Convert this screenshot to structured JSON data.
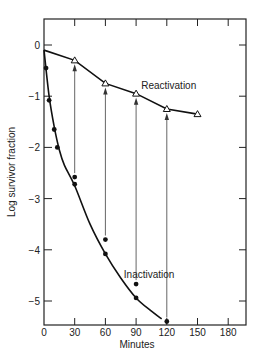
{
  "chart_data": {
    "type": "line",
    "title": "",
    "xlabel": "Minutes",
    "ylabel": "Log survivor fraction",
    "xlim": [
      0,
      195
    ],
    "ylim": [
      -5.5,
      0.5
    ],
    "xticks": [
      0,
      30,
      60,
      90,
      120,
      150,
      180
    ],
    "xtick_labels": [
      "0",
      "30",
      "60",
      "90",
      "120",
      "150",
      "180"
    ],
    "yticks": [
      0,
      -1,
      -2,
      -3,
      -4,
      -5
    ],
    "ytick_labels": [
      "0",
      "−1",
      "−2",
      "−3",
      "−4",
      "−5"
    ],
    "grid": false,
    "legend": null,
    "series": [
      {
        "name": "Reactivation",
        "marker": "open-triangle",
        "x": [
          30,
          60,
          90,
          120,
          150
        ],
        "values": [
          -0.3,
          -0.75,
          -0.95,
          -1.25,
          -1.35
        ],
        "curve_x": [
          0,
          30,
          60,
          90,
          120,
          150
        ],
        "curve_y": [
          -0.1,
          -0.3,
          -0.75,
          -0.95,
          -1.25,
          -1.35
        ]
      },
      {
        "name": "Inactivation",
        "marker": "filled-circle",
        "x": [
          2,
          5,
          10,
          13,
          30,
          30,
          60,
          60,
          90,
          90,
          120
        ],
        "values": [
          -0.45,
          -1.08,
          -1.65,
          -2.0,
          -2.58,
          -2.72,
          -3.8,
          -4.08,
          -4.67,
          -4.94,
          -5.4
        ],
        "curve_x": [
          0,
          5,
          10,
          15,
          20,
          30,
          45,
          60,
          75,
          90,
          105,
          115
        ],
        "curve_y": [
          -0.1,
          -1.0,
          -1.6,
          -2.05,
          -2.35,
          -2.75,
          -3.5,
          -4.08,
          -4.55,
          -4.94,
          -5.2,
          -5.35
        ]
      }
    ],
    "arrows": [
      {
        "x": 30,
        "from": -2.58,
        "to": -0.3
      },
      {
        "x": 60,
        "from": -3.8,
        "to": -0.75
      },
      {
        "x": 90,
        "from": -4.67,
        "to": -0.95
      },
      {
        "x": 120,
        "from": -5.4,
        "to": -1.25
      }
    ],
    "annotations": [
      {
        "text": "Reactivation",
        "x": 95,
        "y": -0.85
      },
      {
        "text": "Inactivation",
        "x": 78,
        "y": -4.55
      }
    ]
  }
}
